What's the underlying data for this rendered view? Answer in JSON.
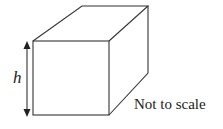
{
  "diagram": {
    "shape": "cuboid",
    "dimension_label": "h",
    "note": "Not to scale",
    "stroke_color": "#333333"
  }
}
